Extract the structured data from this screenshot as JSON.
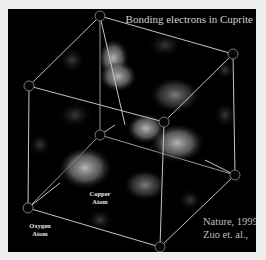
{
  "figure": {
    "title": "Bonding electrons in Cuprite",
    "labels": {
      "copper": [
        "Copper",
        "Atom"
      ],
      "oxygen": [
        "Oxygen",
        "Atom"
      ]
    },
    "credit": {
      "line1": "Nature, 1999",
      "line2": "Zuo et. al.,"
    },
    "colors": {
      "background": "#000000",
      "page": "#eeeeee",
      "edge": "#bdbdbd",
      "cloud": "#9a9a9a"
    }
  }
}
